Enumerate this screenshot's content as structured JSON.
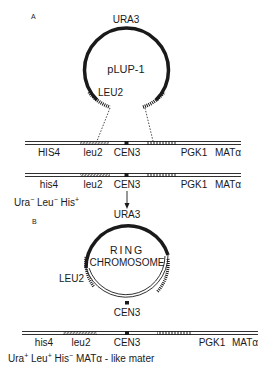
{
  "panels": [
    {
      "id": "A",
      "label": "A",
      "plasmid": {
        "name": "pLUP-1",
        "top_gene": "URA3",
        "left_gene": "LEU2"
      },
      "chromosome_before": {
        "loci": [
          "HIS4",
          "leu2",
          "CEN3",
          "PGK1",
          "MATα"
        ]
      },
      "chromosome_after": {
        "loci": [
          "his4",
          "leu2",
          "CEN3",
          "PGK1",
          "MATα"
        ]
      },
      "phenotype": {
        "parts": [
          {
            "base": "Ura",
            "sup": "−"
          },
          {
            "base": "Leu",
            "sup": "−"
          },
          {
            "base": "His",
            "sup": "+"
          }
        ]
      }
    },
    {
      "id": "B",
      "label": "B",
      "ring": {
        "name_line1": "RING",
        "name_line2": "CHROMOSOME",
        "top_gene": "URA3",
        "left_gene": "LEU2",
        "bottom_gene": "CEN3"
      },
      "chromosome": {
        "loci": [
          "his4",
          "leu2",
          "CEN3",
          "PGK1",
          "MATα"
        ]
      },
      "phenotype": {
        "parts": [
          {
            "base": "Ura",
            "sup": "+"
          },
          {
            "base": "Leu",
            "sup": "+"
          },
          {
            "base": "His",
            "sup": "−"
          }
        ],
        "suffix": "MATα - like mater"
      }
    }
  ],
  "colors": {
    "ink": "#1a1a1a",
    "background": "#ffffff"
  }
}
